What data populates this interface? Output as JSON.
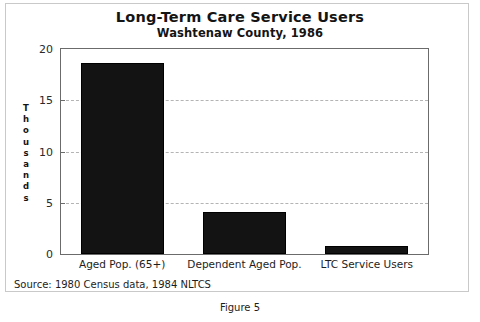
{
  "figure": {
    "caption": "Figure 5",
    "source_note": "Source: 1980 Census data, 1984 NLTCS"
  },
  "chart_data": {
    "type": "bar",
    "title": "Long-Term Care Service Users",
    "subtitle": "Washtenaw County, 1986",
    "xlabel": "",
    "ylabel": "Thousands",
    "categories": [
      "Aged Pop. (65+)",
      "Dependent Aged Pop.",
      "LTC Service Users"
    ],
    "values": [
      18.6,
      4.1,
      0.8
    ],
    "ylim": [
      0,
      20
    ],
    "yticks": [
      0,
      5,
      10,
      15,
      20
    ],
    "ytick_labels": [
      "0",
      "5",
      "10",
      "15",
      "20"
    ],
    "grid": true,
    "legend": "none",
    "bar_color": "#131313"
  }
}
